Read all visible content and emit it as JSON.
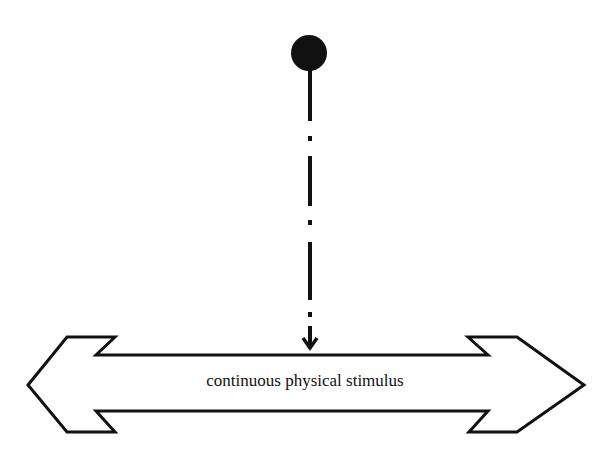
{
  "diagram": {
    "label": "continuous physical stimulus",
    "colors": {
      "stroke": "#111111",
      "background": "#ffffff"
    },
    "elements": {
      "source": "filled-circle",
      "connector": "dash-dot-arrow-down",
      "stimulus": "double-headed-block-arrow"
    }
  }
}
